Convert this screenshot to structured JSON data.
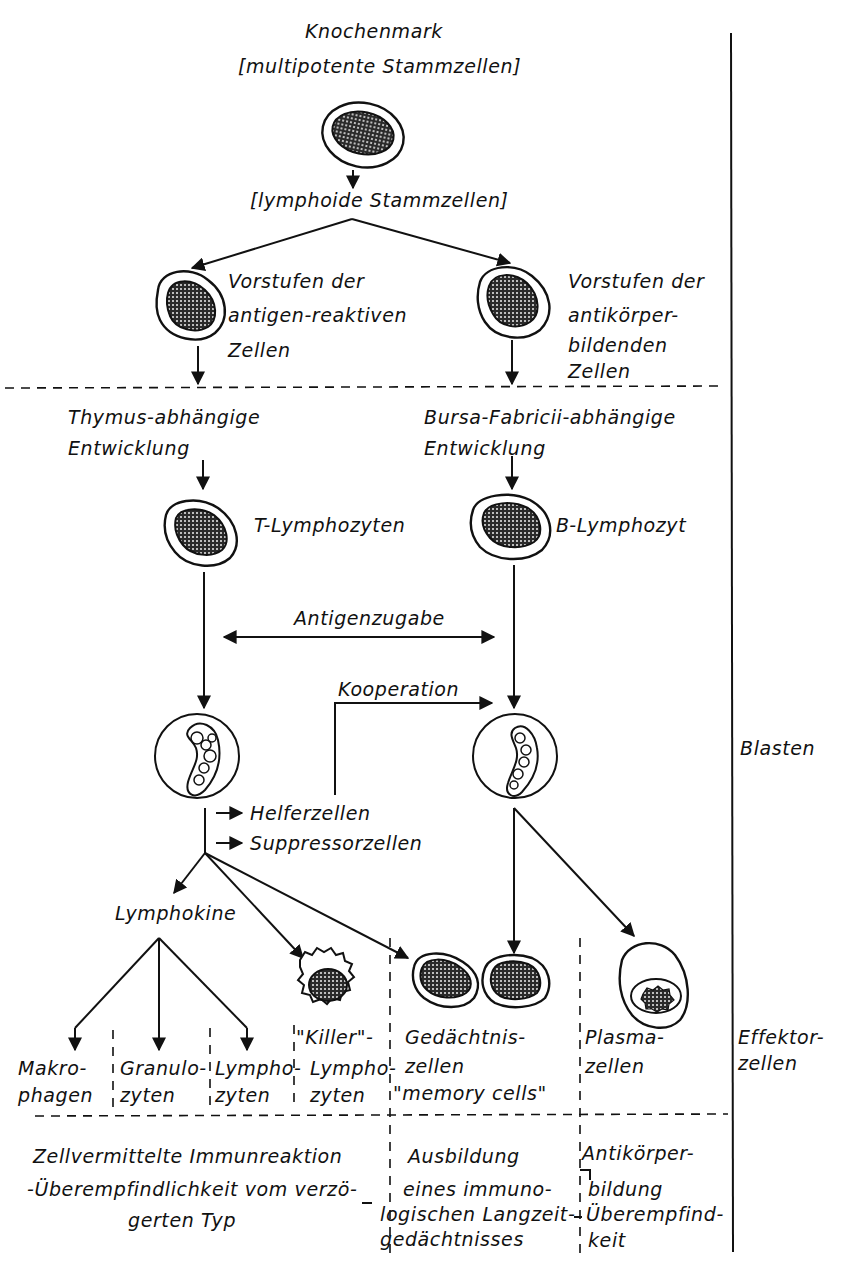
{
  "diagram": {
    "top": {
      "title": "Knochenmark",
      "subtitle": "[multipotente Stammzellen]",
      "lymphoid": "[lymphoide Stammzellen]"
    },
    "left_branch": {
      "precursor_lines": [
        "Vorstufen der",
        "antigen-reaktiven",
        "Zellen"
      ],
      "development_lines": [
        "Thymus-abhängige",
        "Entwicklung"
      ],
      "cell": "T-Lymphozyten",
      "helper": "Helferzellen",
      "suppressor": "Suppressorzellen",
      "lymphokine": "Lymphokine"
    },
    "right_branch": {
      "precursor_lines": [
        "Vorstufen der",
        "antikörper-",
        "bildenden",
        "Zellen"
      ],
      "development_lines": [
        "Bursa-Fabricii-abhängige",
        "Entwicklung"
      ],
      "cell": "B-Lymphozyt"
    },
    "middle": {
      "antigen": "Antigenzugabe",
      "cooperation": "Kooperation"
    },
    "effector_cells": [
      {
        "lines": [
          "Makro-",
          "phagen"
        ]
      },
      {
        "lines": [
          "Granulo-",
          "zyten"
        ]
      },
      {
        "lines": [
          "Lympho-",
          "zyten"
        ]
      },
      {
        "lines": [
          "\"Killer\"-",
          "Lympho-",
          "zyten"
        ]
      },
      {
        "lines": [
          "Gedächtnis-",
          "zellen",
          "\"memory cells\""
        ]
      },
      {
        "lines": [
          "Plasma-",
          "zellen"
        ]
      }
    ],
    "outcomes": {
      "cellular": [
        "Zellvermittelte Immunreaktion",
        "-Überempfindlichkeit vom verzö-",
        "gerten Typ"
      ],
      "memory": [
        "Ausbildung",
        "eines immuno-",
        "logischen Langzeit-",
        "gedächtnisses"
      ],
      "antibody": [
        "Antikörper-",
        "bildung",
        "Überempfind-",
        "keit"
      ]
    },
    "stages": {
      "blasten": "Blasten",
      "effektor_lines": [
        "Effektor-",
        "zellen"
      ]
    }
  }
}
